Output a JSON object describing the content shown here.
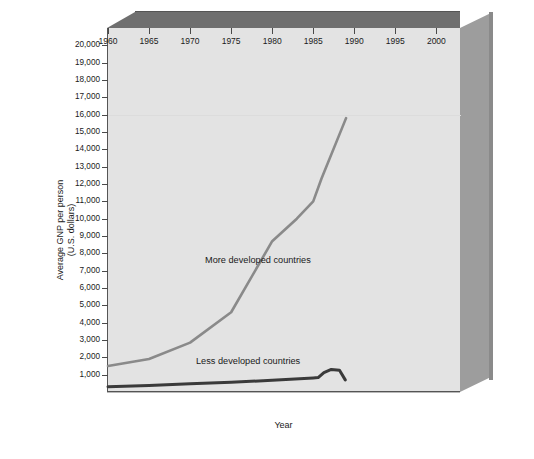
{
  "figure": {
    "background": "#ffffff",
    "plot_background": "#e3e3e3",
    "frame_top_color": "#6f6f6f",
    "frame_side_color": "#9d9d9d"
  },
  "axes": {
    "y_title_line1": "Average GNP per person",
    "y_title_line2": "(U.S. dollars)",
    "x_title": "Year",
    "y_ticks": [
      "1,000",
      "2,000",
      "3,000",
      "4,000",
      "5,000",
      "6,000",
      "7,000",
      "8,000",
      "9,000",
      "10,000",
      "11,000",
      "12,000",
      "13,000",
      "14,000",
      "15,000",
      "16,000",
      "17,000",
      "18,000",
      "19,000",
      "20,000"
    ],
    "x_ticks": [
      "1960",
      "1965",
      "1970",
      "1975",
      "1980",
      "1985",
      "1990",
      "1995",
      "2000"
    ]
  },
  "chart_data": {
    "type": "line",
    "title": "",
    "xlabel": "Year",
    "ylabel": "Average GNP per person (U.S. dollars)",
    "xlim": [
      1960,
      2003
    ],
    "ylim": [
      0,
      21000
    ],
    "grid": false,
    "legend_position": "inline-annotation",
    "x_tick_values": [
      1960,
      1965,
      1970,
      1975,
      1980,
      1985,
      1990,
      1995,
      2000
    ],
    "y_tick_values": [
      1000,
      2000,
      3000,
      4000,
      5000,
      6000,
      7000,
      8000,
      9000,
      10000,
      11000,
      12000,
      13000,
      14000,
      15000,
      16000,
      17000,
      18000,
      19000,
      20000
    ],
    "series": [
      {
        "name": "More developed countries",
        "color": "#8a8a8a",
        "line_width": 2.6,
        "label_text": "More developed countries",
        "x": [
          1960,
          1965,
          1970,
          1975,
          1980,
          1983,
          1985,
          1986,
          1989
        ],
        "values": [
          1500,
          1900,
          2850,
          4600,
          8700,
          10000,
          11000,
          12300,
          15800
        ]
      },
      {
        "name": "Less developed countries",
        "color": "#3a3a3a",
        "line_width": 3.0,
        "label_text": "Less developed countries",
        "x": [
          1960,
          1965,
          1970,
          1975,
          1980,
          1985,
          1985.6,
          1986.3,
          1987.2,
          1988.2,
          1988.9
        ],
        "values": [
          300,
          380,
          470,
          560,
          680,
          810,
          830,
          1120,
          1300,
          1250,
          700
        ]
      }
    ]
  }
}
